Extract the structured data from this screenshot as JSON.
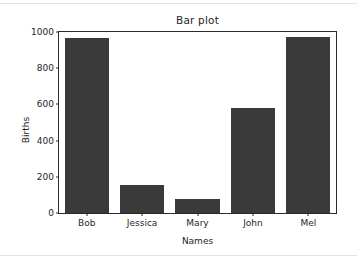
{
  "chart_data": {
    "type": "bar",
    "title": "Bar plot",
    "xlabel": "Names",
    "ylabel": "Births",
    "categories": [
      "Bob",
      "Jessica",
      "Mary",
      "John",
      "Mel"
    ],
    "values": [
      968,
      155,
      77,
      578,
      973
    ],
    "ylim": [
      0,
      1000
    ],
    "yticks": [
      0,
      200,
      400,
      600,
      800,
      1000
    ],
    "ytick_labels": [
      "0",
      "200",
      "400",
      "600",
      "800",
      "1000"
    ],
    "grid": false,
    "legend": null,
    "bar_color": "#3a3a3a",
    "background_color": "#ffffff",
    "axis_color": "#2b2b2b"
  }
}
